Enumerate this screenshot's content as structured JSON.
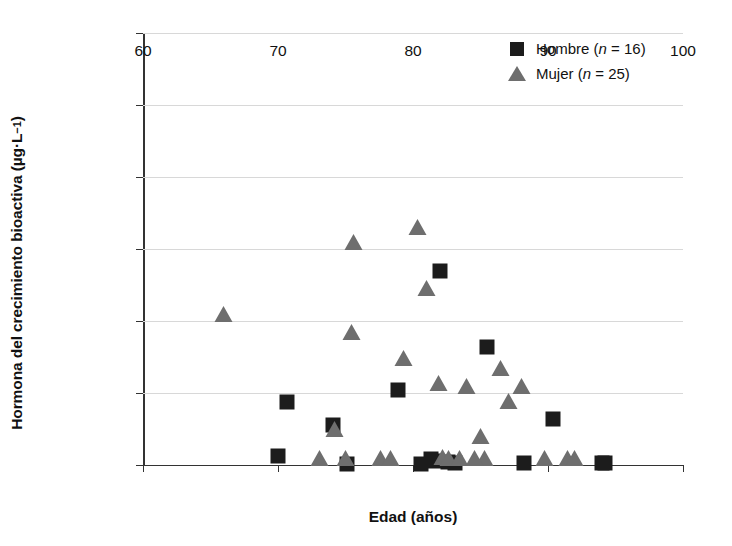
{
  "chart_data": {
    "type": "scatter",
    "title": "",
    "xlabel": "Edad (años)",
    "ylabel": "Hormona del crecimiento bioactiva (µg·L⁻¹)",
    "ylabel_main": "Hormona del crecimiento bioactiva (µg·L",
    "ylabel_sup": "−1",
    "ylabel_tail": ")",
    "xlim": [
      60,
      100
    ],
    "ylim": [
      0,
      30000
    ],
    "xticks": [
      60,
      70,
      80,
      90,
      100
    ],
    "xtick_labels": [
      "60",
      "70",
      "80",
      "90",
      "100"
    ],
    "yticks": [
      0,
      5000,
      10000,
      15000,
      20000,
      25000,
      30000
    ],
    "ytick_labels": [
      "0",
      "5 000",
      "10 000",
      "15 000",
      "20 000",
      "25 000",
      "30 000"
    ],
    "grid": "horizontal",
    "legend_position": "top-right",
    "colors": {
      "hombre": "#1c1c1c",
      "mujer": "#6e6e6e",
      "gridline": "#d8d8d8",
      "axis": "#333333",
      "background": "#ffffff"
    },
    "series": [
      {
        "name": "Hombre",
        "n": 16,
        "legend_label": "Hombre (n = 16)",
        "marker": "square",
        "color": "#1c1c1c",
        "points": [
          {
            "x": 70.0,
            "y": 600
          },
          {
            "x": 70.7,
            "y": 4400
          },
          {
            "x": 74.1,
            "y": 2800
          },
          {
            "x": 75.1,
            "y": 100
          },
          {
            "x": 78.9,
            "y": 5200
          },
          {
            "x": 80.6,
            "y": 100
          },
          {
            "x": 81.3,
            "y": 400
          },
          {
            "x": 81.6,
            "y": 300
          },
          {
            "x": 82.0,
            "y": 13500
          },
          {
            "x": 82.6,
            "y": 200
          },
          {
            "x": 83.1,
            "y": 150
          },
          {
            "x": 85.5,
            "y": 8200
          },
          {
            "x": 88.2,
            "y": 150
          },
          {
            "x": 90.4,
            "y": 3200
          },
          {
            "x": 94.0,
            "y": 150
          },
          {
            "x": 94.2,
            "y": 120
          }
        ]
      },
      {
        "name": "Mujer",
        "n": 25,
        "legend_label": "Mujer (n = 25)",
        "marker": "triangle",
        "color": "#6e6e6e",
        "points": [
          {
            "x": 66.0,
            "y": 10100
          },
          {
            "x": 73.1,
            "y": 100
          },
          {
            "x": 74.2,
            "y": 2100
          },
          {
            "x": 75.0,
            "y": 100
          },
          {
            "x": 75.5,
            "y": 8800
          },
          {
            "x": 75.6,
            "y": 15100
          },
          {
            "x": 77.6,
            "y": 100
          },
          {
            "x": 78.4,
            "y": 100
          },
          {
            "x": 79.3,
            "y": 7000
          },
          {
            "x": 80.4,
            "y": 16100
          },
          {
            "x": 81.0,
            "y": 11900
          },
          {
            "x": 81.9,
            "y": 5300
          },
          {
            "x": 82.2,
            "y": 150
          },
          {
            "x": 82.7,
            "y": 100
          },
          {
            "x": 83.5,
            "y": 100
          },
          {
            "x": 84.0,
            "y": 5100
          },
          {
            "x": 85.0,
            "y": 1600
          },
          {
            "x": 85.3,
            "y": 100
          },
          {
            "x": 86.5,
            "y": 6300
          },
          {
            "x": 87.1,
            "y": 4000
          },
          {
            "x": 88.1,
            "y": 5100
          },
          {
            "x": 89.8,
            "y": 100
          },
          {
            "x": 91.5,
            "y": 100
          },
          {
            "x": 92.0,
            "y": 80
          },
          {
            "x": 84.6,
            "y": 60
          }
        ]
      }
    ]
  }
}
